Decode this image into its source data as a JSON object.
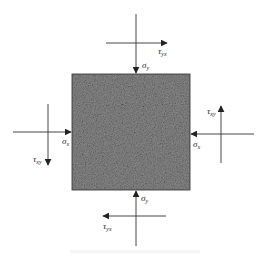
{
  "diagram": {
    "colors": {
      "element_fill": "#777777",
      "element_border": "#555555",
      "line": "#333333",
      "background": "#ffffff"
    },
    "element": {
      "x": 72,
      "y": 74,
      "width": 118,
      "height": 116,
      "texture": "granular-speckle"
    },
    "labels": {
      "sigma_y_top": {
        "symbol": "σ",
        "sub": "y"
      },
      "tau_yx_top": {
        "symbol": "τ",
        "sub": "yx"
      },
      "sigma_x_left": {
        "symbol": "σ",
        "sub": "x"
      },
      "tau_xy_left": {
        "symbol": "τ",
        "sub": "xy"
      },
      "sigma_x_right": {
        "symbol": "σ",
        "sub": "x"
      },
      "tau_xy_right": {
        "symbol": "τ",
        "sub": "xy"
      },
      "sigma_y_bottom": {
        "symbol": "σ",
        "sub": "y"
      },
      "tau_yx_bottom": {
        "symbol": "τ",
        "sub": "yx"
      }
    },
    "arrows": [
      {
        "name": "sigma-y-top",
        "direction": "down",
        "from": [
          136,
          14
        ],
        "to": [
          136,
          73
        ]
      },
      {
        "name": "tau-yx-top",
        "direction": "right",
        "from": [
          106,
          43
        ],
        "to": [
          167,
          43
        ]
      },
      {
        "name": "sigma-x-left",
        "direction": "right",
        "from": [
          13,
          132
        ],
        "to": [
          71,
          132
        ]
      },
      {
        "name": "tau-xy-left",
        "direction": "down",
        "from": [
          48,
          104
        ],
        "to": [
          48,
          165
        ]
      },
      {
        "name": "sigma-x-right",
        "direction": "left",
        "from": [
          254,
          134
        ],
        "to": [
          191,
          134
        ]
      },
      {
        "name": "tau-xy-right",
        "direction": "up",
        "from": [
          221,
          163
        ],
        "to": [
          221,
          106
        ]
      },
      {
        "name": "sigma-y-bottom",
        "direction": "up",
        "from": [
          136,
          246
        ],
        "to": [
          136,
          191
        ]
      },
      {
        "name": "tau-yx-bottom",
        "direction": "left",
        "from": [
          166,
          216
        ],
        "to": [
          103,
          216
        ]
      }
    ]
  }
}
